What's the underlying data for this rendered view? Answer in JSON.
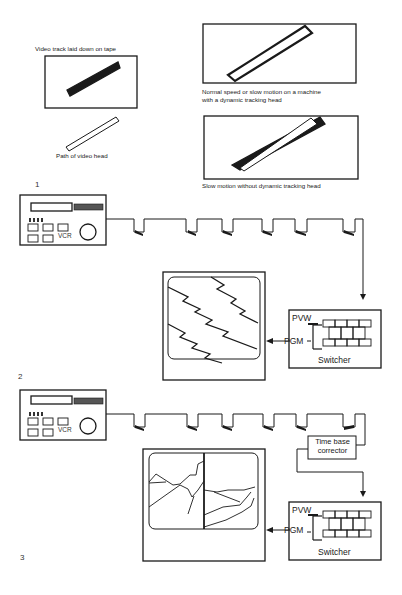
{
  "figure": {
    "panel1": {
      "number": "1",
      "captions": {
        "track_on_tape": "Video track laid down on tape",
        "head_path": "Path of video head",
        "dynamic_tracking": "Normal speed or slow motion on a machine",
        "dynamic_tracking_2": "with a dynamic tracking head",
        "no_dynamic_tracking": "Slow motion without dynamic tracking head"
      }
    },
    "panel2": {
      "number": "2",
      "vcr_label": "VCR",
      "switcher": {
        "title": "Switcher",
        "pvw": "PVW",
        "pgm": "PGM"
      }
    },
    "panel3": {
      "number": "3",
      "vcr_label": "VCR",
      "tbc_line1": "Time base",
      "tbc_line2": "corrector",
      "switcher": {
        "title": "Switcher",
        "pvw": "PVW",
        "pgm": "PGM"
      }
    },
    "colors": {
      "ink": "#1a1a1a",
      "paper": "#ffffff"
    }
  }
}
